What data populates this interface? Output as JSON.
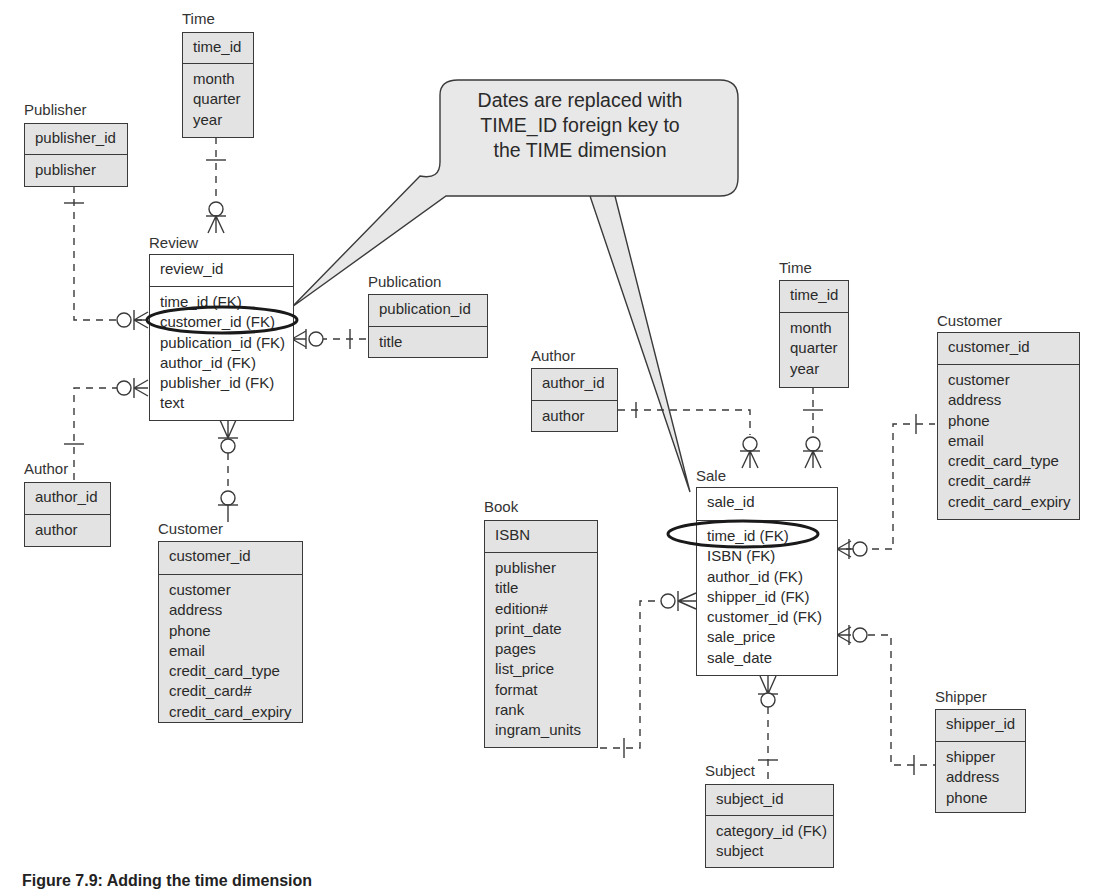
{
  "figure": {
    "callout": {
      "lines": [
        "Dates are replaced with",
        "TIME_ID foreign key to",
        "the TIME dimension"
      ]
    },
    "caption": "Figure 7.9: Adding the time dimension"
  },
  "entities": {
    "time_review": {
      "name": "Time",
      "pk": "time_id",
      "attrs": [
        "month",
        "quarter",
        "year"
      ]
    },
    "publisher": {
      "name": "Publisher",
      "pk": "publisher_id",
      "attrs": [
        "publisher"
      ]
    },
    "review": {
      "name": "Review",
      "pk": "review_id",
      "attrs": [
        "time_id (FK)",
        "customer_id (FK)",
        "publication_id (FK)",
        "author_id (FK)",
        "publisher_id (FK)",
        "text"
      ]
    },
    "publication": {
      "name": "Publication",
      "pk": "publication_id",
      "attrs": [
        "title"
      ]
    },
    "author_review": {
      "name": "Author",
      "pk": "author_id",
      "attrs": [
        "author"
      ]
    },
    "customer_review": {
      "name": "Customer",
      "pk": "customer_id",
      "attrs": [
        "customer",
        "address",
        "phone",
        "email",
        "credit_card_type",
        "credit_card#",
        "credit_card_expiry"
      ]
    },
    "time_sale": {
      "name": "Time",
      "pk": "time_id",
      "attrs": [
        "month",
        "quarter",
        "year"
      ]
    },
    "author_sale": {
      "name": "Author",
      "pk": "author_id",
      "attrs": [
        "author"
      ]
    },
    "customer_sale": {
      "name": "Customer",
      "pk": "customer_id",
      "attrs": [
        "customer",
        "address",
        "phone",
        "email",
        "credit_card_type",
        "credit_card#",
        "credit_card_expiry"
      ]
    },
    "book": {
      "name": "Book",
      "pk": "ISBN",
      "attrs": [
        "publisher",
        "title",
        "edition#",
        "print_date",
        "pages",
        "list_price",
        "format",
        "rank",
        "ingram_units"
      ]
    },
    "sale": {
      "name": "Sale",
      "pk": "sale_id",
      "attrs": [
        "time_id (FK)",
        "ISBN (FK)",
        "author_id (FK)",
        "shipper_id (FK)",
        "customer_id (FK)",
        "sale_price",
        "sale_date"
      ]
    },
    "shipper": {
      "name": "Shipper",
      "pk": "shipper_id",
      "attrs": [
        "shipper",
        "address",
        "phone"
      ]
    },
    "subject": {
      "name": "Subject",
      "pk": "subject_id",
      "attrs": [
        "category_id (FK)",
        "subject"
      ]
    }
  },
  "highlights": [
    "Review.customer_id (FK)",
    "Sale.time_id (FK)"
  ],
  "colors": {
    "entity_fill": "#e3e3e3",
    "line": "#3a3a3a",
    "callout_fill": "#e8e8e8"
  }
}
